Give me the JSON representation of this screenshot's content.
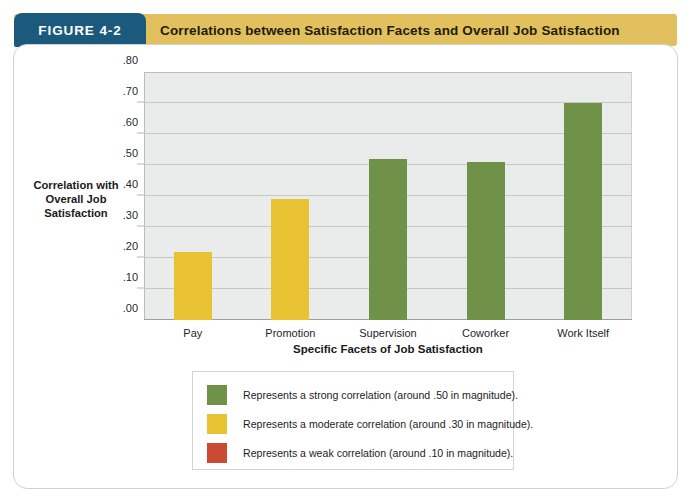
{
  "header": {
    "figure_tab_label": "FIGURE 4-2",
    "title": "Correlations between Satisfaction Facets and Overall Job Satisfaction",
    "tab_color": "#1c5a7d",
    "band_color": "#e2c05d"
  },
  "colors": {
    "strong": "#6f9148",
    "moderate": "#e9c234",
    "weak": "#cb4a32",
    "plot_background": "#e9eceb",
    "gridline": "#c4c8c6"
  },
  "legend": {
    "entries": [
      {
        "swatch": "strong",
        "label": "Represents a strong correlation (around .50 in magnitude)."
      },
      {
        "swatch": "moderate",
        "label": "Represents a moderate correlation (around .30 in magnitude)."
      },
      {
        "swatch": "weak",
        "label": "Represents a weak correlation (around .10 in magnitude)."
      }
    ]
  },
  "chart_data": {
    "type": "bar",
    "title": "Correlations between Satisfaction Facets and Overall Job Satisfaction",
    "subtitle": "",
    "xlabel": "Specific Facets of Job Satisfaction",
    "ylabel": "Correlation with Overall Job Satisfaction",
    "ylabel_lines": [
      "Correlation with",
      "Overall Job",
      "Satisfaction"
    ],
    "categories": [
      "Pay",
      "Promotion",
      "Supervision",
      "Coworker",
      "Work Itself"
    ],
    "values": [
      0.22,
      0.39,
      0.52,
      0.51,
      0.7
    ],
    "value_labels": [
      ".22",
      ".39",
      ".52",
      ".51",
      ".70"
    ],
    "bar_classes": [
      "moderate",
      "moderate",
      "strong",
      "strong",
      "strong"
    ],
    "ylim": [
      0.0,
      0.8
    ],
    "ytick_values": [
      0.0,
      0.1,
      0.2,
      0.3,
      0.4,
      0.5,
      0.6,
      0.7,
      0.8
    ],
    "ytick_labels": [
      ".00",
      ".10",
      ".20",
      ".30",
      ".40",
      ".50",
      ".60",
      ".70",
      ".80"
    ],
    "grid": true,
    "grid_axis": "y",
    "legend_position": "below-plot"
  }
}
